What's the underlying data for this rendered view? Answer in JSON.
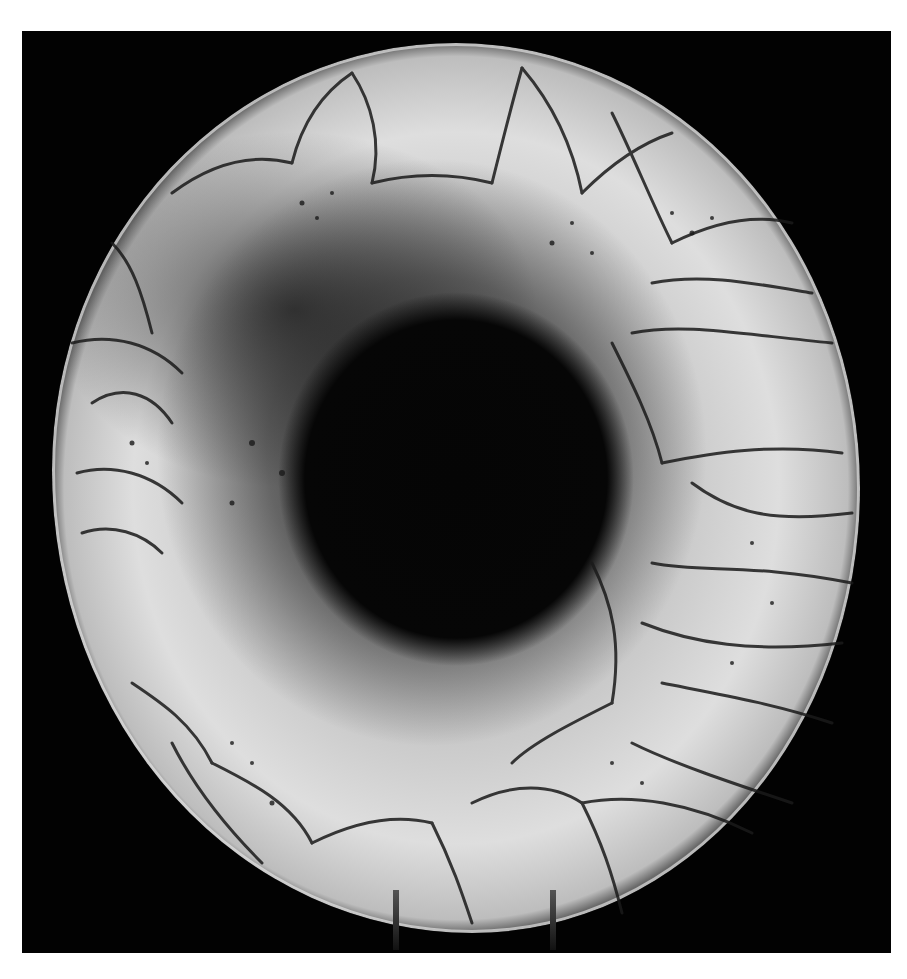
{
  "image": {
    "subject": "raku-fired ceramic plate with crackle glaze on display stand",
    "style": "grayscale photograph",
    "background_color": "#020202",
    "margin_color": "#ffffff",
    "frame": {
      "left": 22,
      "top": 31,
      "right": 891,
      "bottom": 953
    },
    "plate": {
      "center": [
        453,
        470
      ],
      "radius_x": 404,
      "radius_y": 445,
      "glaze_color": "#d4d4d4",
      "crackle_color": "#1a1a1a",
      "center_color": "#050505"
    },
    "stand_legs": [
      {
        "x": 393,
        "y": 890
      },
      {
        "x": 550,
        "y": 890
      }
    ]
  }
}
